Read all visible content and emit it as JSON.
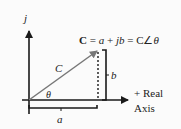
{
  "diagram": {
    "equation": {
      "C": "C",
      "rest": " = a + jb = C∠θ"
    },
    "equation_parts": [
      "C",
      " = ",
      "a",
      " + ",
      "jb",
      " = C∠",
      "θ"
    ],
    "labels": {
      "imag_axis": "j",
      "vector": "C",
      "angle": "θ",
      "vertical_component": "b",
      "horizontal_component": "a",
      "real_axis_line1": "+ Real",
      "real_axis_line2": "Axis"
    },
    "colors": {
      "background": "#fbfbfb",
      "axis": "#1a1a1a",
      "vector": "#777777",
      "text": "#222222"
    }
  }
}
